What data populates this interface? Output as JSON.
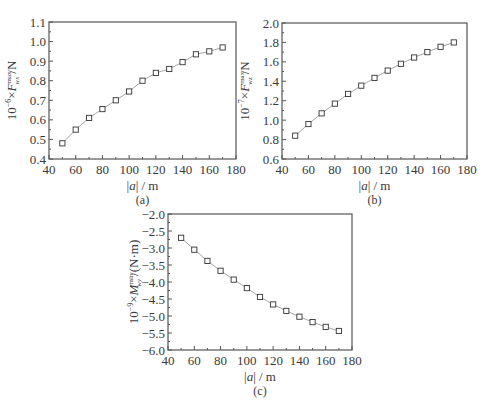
{
  "figure": {
    "panels": [
      "(a)",
      "(b)",
      "(c)"
    ]
  },
  "chart_data": [
    {
      "type": "line",
      "panel_label": "(a)",
      "title": "",
      "xlabel": "|a| / m",
      "ylabel": "10^-6 × F_wx^max / N",
      "ylabel_parts": {
        "prefix": "10",
        "exp": "−6",
        "mid": "×F",
        "sup": "max",
        "sub": "wx",
        "suffix": "/N"
      },
      "xlim": [
        40,
        180
      ],
      "ylim": [
        0.4,
        1.1
      ],
      "xticks": [
        40,
        60,
        80,
        100,
        120,
        140,
        160,
        180
      ],
      "yticks": [
        0.4,
        0.5,
        0.6,
        0.7,
        0.8,
        0.9,
        1.0,
        1.1
      ],
      "ytick_labels": [
        "0.4",
        "0.5",
        "0.6",
        "0.7",
        "0.8",
        "0.9",
        "1.0",
        "1.1"
      ],
      "grid": false,
      "marker": "open-square",
      "x": [
        50,
        60,
        70,
        80,
        90,
        100,
        110,
        120,
        130,
        140,
        150,
        160,
        170
      ],
      "y": [
        0.48,
        0.55,
        0.61,
        0.655,
        0.7,
        0.745,
        0.8,
        0.84,
        0.86,
        0.895,
        0.935,
        0.95,
        0.97
      ],
      "frame": {
        "left": 49,
        "top": 22,
        "right": 236,
        "bottom": 159
      }
    },
    {
      "type": "line",
      "panel_label": "(b)",
      "title": "",
      "xlabel": "|a| / m",
      "ylabel": "10^-7 × F_wz^max / N",
      "ylabel_parts": {
        "prefix": "10",
        "exp": "−7",
        "mid": "×F",
        "sup": "max",
        "sub": "wz",
        "suffix": "/N"
      },
      "xlim": [
        40,
        180
      ],
      "ylim": [
        0.6,
        2.0
      ],
      "xticks": [
        40,
        60,
        80,
        100,
        120,
        140,
        160,
        180
      ],
      "yticks": [
        0.6,
        0.8,
        1.0,
        1.2,
        1.4,
        1.6,
        1.8,
        2.0
      ],
      "ytick_labels": [
        "0.6",
        "0.8",
        "1.0",
        "1.2",
        "1.4",
        "1.6",
        "1.8",
        "2.0"
      ],
      "grid": false,
      "marker": "open-square",
      "x": [
        50,
        60,
        70,
        80,
        90,
        100,
        110,
        120,
        130,
        140,
        150,
        160,
        170
      ],
      "y": [
        0.84,
        0.96,
        1.07,
        1.17,
        1.27,
        1.355,
        1.435,
        1.51,
        1.58,
        1.645,
        1.7,
        1.755,
        1.8
      ],
      "frame": {
        "left": 282,
        "top": 23,
        "right": 467,
        "bottom": 159
      }
    },
    {
      "type": "line",
      "panel_label": "(c)",
      "title": "",
      "xlabel": "|a| / m",
      "ylabel": "10^-9 × M_wy^min / (N·m)",
      "ylabel_parts": {
        "prefix": "10",
        "exp": "−9",
        "mid": "×M",
        "sup": "min",
        "sub": "wy",
        "suffix": "/(N·m)"
      },
      "xlim": [
        40,
        180
      ],
      "ylim": [
        -6.0,
        -2.0
      ],
      "xticks": [
        40,
        60,
        80,
        100,
        120,
        140,
        160,
        180
      ],
      "yticks": [
        -6.0,
        -5.5,
        -5.0,
        -4.5,
        -4.0,
        -3.5,
        -3.0,
        -2.5,
        -2.0
      ],
      "ytick_labels": [
        "−6.0",
        "−5.5",
        "−5.0",
        "−4.5",
        "−4.0",
        "−3.5",
        "−3.0",
        "−2.5",
        "−2.0"
      ],
      "grid": false,
      "marker": "open-square",
      "x": [
        50,
        60,
        70,
        80,
        90,
        100,
        110,
        120,
        130,
        140,
        150,
        160,
        170
      ],
      "y": [
        -2.7,
        -3.05,
        -3.38,
        -3.67,
        -3.93,
        -4.18,
        -4.44,
        -4.66,
        -4.85,
        -5.02,
        -5.18,
        -5.32,
        -5.44
      ],
      "frame": {
        "left": 168,
        "top": 214,
        "right": 352,
        "bottom": 350
      }
    }
  ]
}
